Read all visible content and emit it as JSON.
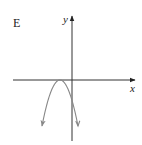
{
  "figure": {
    "label": "E",
    "x_axis_label": "x",
    "y_axis_label": "y",
    "curve": {
      "type": "parabola",
      "opens": "down",
      "vertex_position": "on negative x-axis, touching x-axis",
      "ends_with_arrows": true
    },
    "colors": {
      "axis": "#333333",
      "curve": "#888888",
      "text": "#222222"
    }
  }
}
